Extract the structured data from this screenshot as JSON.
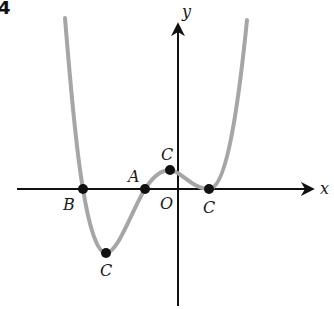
{
  "figure": {
    "number_label": "4",
    "axes": {
      "x_label": "x",
      "y_label": "y",
      "origin_label": "O"
    },
    "points": [
      {
        "id": "B",
        "label": "B",
        "description": "x-intercept (leftmost root)"
      },
      {
        "id": "C_min",
        "label": "C",
        "description": "local minimum below x-axis"
      },
      {
        "id": "A",
        "label": "A",
        "description": "x-intercept (negative root near origin)"
      },
      {
        "id": "C_max",
        "label": "C",
        "description": "local maximum just left of y-axis"
      },
      {
        "id": "C_right",
        "label": "C",
        "description": "local minimum touching x-axis (double root)"
      }
    ],
    "colors": {
      "curve": "#a6a6a6",
      "axes": "#111111",
      "points": "#111111",
      "labels": "#1a1a1a"
    }
  }
}
